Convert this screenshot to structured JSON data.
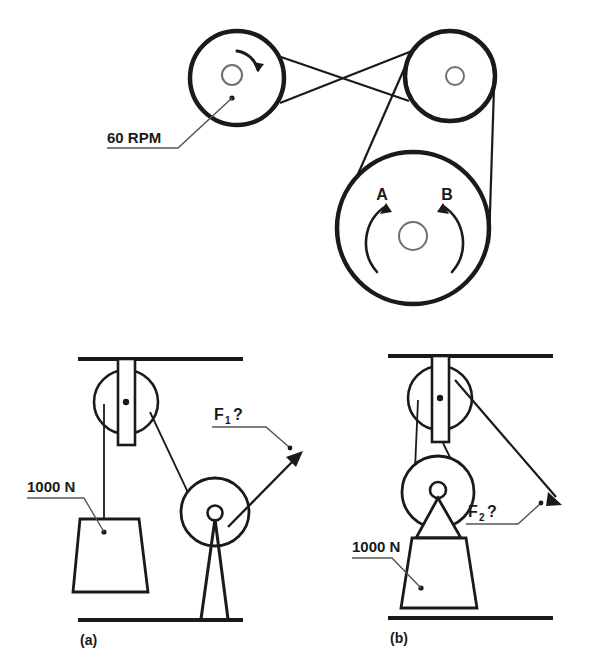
{
  "figure": {
    "title_caption_a": "(a)",
    "title_caption_b": "(b)",
    "labels": {
      "rpm": "60 RPM",
      "point_a": "A",
      "point_b": "B",
      "force1": "F",
      "force1_sub": "1",
      "force1_q": "?",
      "force2": "F",
      "force2_sub": "2",
      "force2_q": "?",
      "load_a": "1000 N",
      "load_b": "1000 N"
    },
    "colors": {
      "stroke": "#1a1a1a",
      "thin_stroke": "#3a3a3a",
      "background": "#ffffff",
      "leader": "#555555"
    },
    "belt_drive": {
      "pulleys": [
        {
          "name": "driver-pulley",
          "cx": 237,
          "cy": 78,
          "r": 47,
          "hub_r": 10,
          "rpm": "60 RPM"
        },
        {
          "name": "idler-pulley",
          "cx": 450,
          "cy": 76,
          "r": 45,
          "hub_r": 9
        },
        {
          "name": "driven-pulley",
          "cx": 413,
          "cy": 228,
          "r": 76,
          "hub_r": 14
        }
      ],
      "belt_type": "crossed",
      "rotation_markers": [
        "A",
        "B"
      ]
    },
    "pulley_systems": [
      {
        "name": "system-a",
        "caption": "(a)",
        "load": "1000 N",
        "force_label": "F1 ?",
        "force_direction": "up-right",
        "fixed_pulley": {
          "cx": 126,
          "cy": 400,
          "r": 32
        },
        "stand_pulley": {
          "cx": 215,
          "cy": 512,
          "r": 34
        }
      },
      {
        "name": "system-b",
        "caption": "(b)",
        "load": "1000 N",
        "force_label": "F2 ?",
        "force_direction": "down-right",
        "fixed_pulley": {
          "cx": 440,
          "cy": 398,
          "r": 32
        },
        "movable_pulley": {
          "cx": 438,
          "cy": 492,
          "r": 36
        }
      }
    ]
  }
}
